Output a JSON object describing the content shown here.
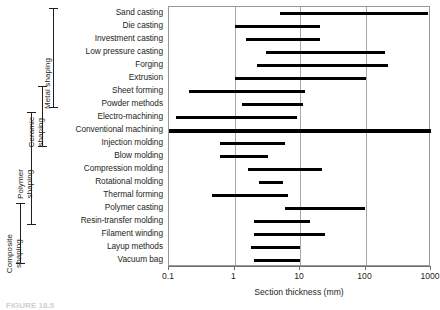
{
  "chart_data": {
    "type": "bar",
    "orientation": "horizontal",
    "title": "",
    "subtitle": "",
    "xlabel": "Section thickness (mm)",
    "ylabel": "",
    "xscale": "log",
    "xlim": [
      0.1,
      1000
    ],
    "xticks": [
      0.1,
      1,
      10,
      100,
      1000
    ],
    "xticklabels": [
      "0.1",
      "1",
      "10",
      "100",
      "1000"
    ],
    "grid": "vertical gridlines at each decade",
    "legend": "none",
    "annotations": "processes bracketed into four shaping families at left",
    "categories": [
      "Sand casting",
      "Die casting",
      "Investment casting",
      "Low pressure casting",
      "Forging",
      "Extrusion",
      "Sheet forming",
      "Powder methods",
      "Electro-machining",
      "Conventional machining",
      "Injection molding",
      "Blow molding",
      "Compression molding",
      "Rotational molding",
      "Thermal forming",
      "Polymer casting",
      "Resin-transfer molding",
      "Filament winding",
      "Layup methods",
      "Vacuum bag"
    ],
    "ranges": [
      {
        "category": "Sand casting",
        "low": 5,
        "high": 900
      },
      {
        "category": "Die casting",
        "low": 1,
        "high": 20
      },
      {
        "category": "Investment casting",
        "low": 1.5,
        "high": 20
      },
      {
        "category": "Low pressure casting",
        "low": 3,
        "high": 200
      },
      {
        "category": "Forging",
        "low": 2.2,
        "high": 220
      },
      {
        "category": "Extrusion",
        "low": 1,
        "high": 100
      },
      {
        "category": "Sheet forming",
        "low": 0.2,
        "high": 12
      },
      {
        "category": "Powder methods",
        "low": 1.3,
        "high": 11
      },
      {
        "category": "Electro-machining",
        "low": 0.13,
        "high": 9
      },
      {
        "category": "Conventional machining",
        "low": 0.1,
        "high": 1000
      },
      {
        "category": "Injection molding",
        "low": 0.6,
        "high": 6
      },
      {
        "category": "Blow molding",
        "low": 0.6,
        "high": 3.2
      },
      {
        "category": "Compression molding",
        "low": 1.6,
        "high": 22
      },
      {
        "category": "Rotational molding",
        "low": 2.4,
        "high": 5.5
      },
      {
        "category": "Thermal forming",
        "low": 0.45,
        "high": 6.5
      },
      {
        "category": "Polymer casting",
        "low": 6,
        "high": 100
      },
      {
        "category": "Resin-transfer molding",
        "low": 2,
        "high": 14
      },
      {
        "category": "Filament winding",
        "low": 2,
        "high": 24
      },
      {
        "category": "Layup methods",
        "low": 1.8,
        "high": 10
      },
      {
        "category": "Vacuum bag",
        "low": 2,
        "high": 10
      }
    ],
    "groups": [
      {
        "label": "Metal shaping",
        "first": "Sand casting",
        "last": "Powder methods"
      },
      {
        "label": "Ceramic\nshaping",
        "first": "Sheet forming",
        "last": "Injection molding"
      },
      {
        "label": "Polymer\nshaping",
        "first": "Electro-machining",
        "last": "Resin-transfer molding"
      },
      {
        "label": "Composite\nshaping",
        "first": "Polymer casting",
        "last": "Vacuum bag"
      }
    ]
  },
  "axis": {
    "title": "Section thickness (mm)",
    "ticklabels": [
      "0.1",
      "1",
      "10",
      "100",
      "1000"
    ]
  },
  "rows": [
    {
      "label": "Sand casting"
    },
    {
      "label": "Die casting"
    },
    {
      "label": "Investment casting"
    },
    {
      "label": "Low pressure casting"
    },
    {
      "label": "Forging"
    },
    {
      "label": "Extrusion"
    },
    {
      "label": "Sheet forming"
    },
    {
      "label": "Powder methods"
    },
    {
      "label": "Electro-machining"
    },
    {
      "label": "Conventional machining"
    },
    {
      "label": "Injection molding"
    },
    {
      "label": "Blow molding"
    },
    {
      "label": "Compression molding"
    },
    {
      "label": "Rotational molding"
    },
    {
      "label": "Thermal forming"
    },
    {
      "label": "Polymer casting"
    },
    {
      "label": "Resin-transfer molding"
    },
    {
      "label": "Filament winding"
    },
    {
      "label": "Layup methods"
    },
    {
      "label": "Vacuum bag"
    }
  ],
  "groups": [
    {
      "label": "Metal shaping"
    },
    {
      "label": "Ceramic\nshaping"
    },
    {
      "label": "Polymer\nshaping"
    },
    {
      "label": "Composite\nshaping"
    }
  ],
  "caption": {
    "text": "FIGURE 18.5"
  },
  "colors": {
    "bar": "#000000",
    "grid": "#a8a8a8",
    "frame": "#9a9a9a",
    "text": "#231f20"
  }
}
